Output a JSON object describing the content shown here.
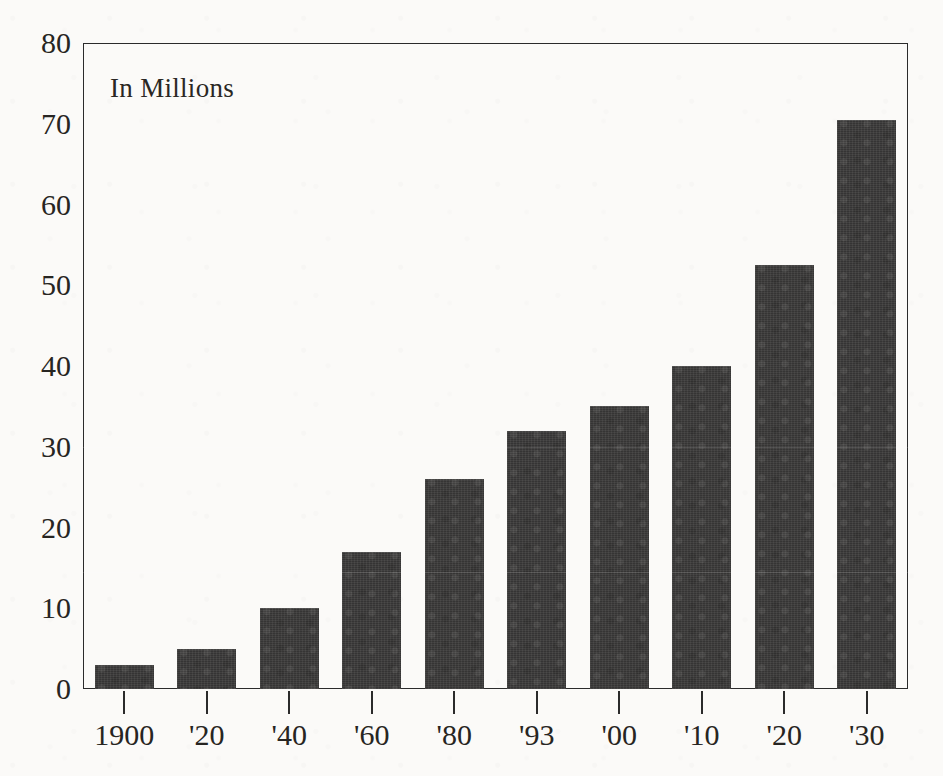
{
  "chart_data": {
    "type": "bar",
    "title": "",
    "subtitle": "",
    "annotation": "In Millions",
    "xlabel": "",
    "ylabel": "",
    "categories": [
      "1900",
      "'20",
      "'40",
      "'60",
      "'80",
      "'93",
      "'00",
      "'10",
      "'20",
      "'30"
    ],
    "values": [
      3,
      5,
      10,
      17,
      26,
      32,
      35,
      40,
      52.5,
      70.5
    ],
    "ylim": [
      0,
      80
    ],
    "y_ticks": [
      0,
      10,
      20,
      30,
      40,
      50,
      60,
      70,
      80
    ],
    "y_tick_labels": [
      "0",
      "10",
      "20",
      "30",
      "40",
      "50",
      "60",
      "70",
      "80"
    ],
    "grid": false,
    "legend": false,
    "legend_position": "none",
    "bar_color": "#3b3a39",
    "frame_color": "#2b2b2b",
    "background_color": "#fbfaf8",
    "text_color": "#272522"
  }
}
